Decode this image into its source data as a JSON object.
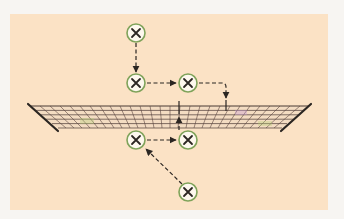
{
  "diagram": {
    "colors": {
      "background": "#f7f5f2",
      "court": "#fbe2c5",
      "marker_fill": "#fdf8ee",
      "marker_ring": "#7fa35a",
      "marker_x": "#2b2622",
      "arrow": "#2b2622",
      "net_line": "#3a2e2a",
      "net_pole": "#2b2622"
    },
    "players": [
      {
        "id": "p1",
        "label": "X",
        "x": 136,
        "y": 33,
        "side": "far"
      },
      {
        "id": "p2",
        "label": "X",
        "x": 136,
        "y": 83,
        "side": "far"
      },
      {
        "id": "p3",
        "label": "X",
        "x": 188,
        "y": 83,
        "side": "far"
      },
      {
        "id": "p4",
        "label": "X",
        "x": 136,
        "y": 140,
        "side": "near"
      },
      {
        "id": "p5",
        "label": "X",
        "x": 188,
        "y": 140,
        "side": "near"
      },
      {
        "id": "p6",
        "label": "X",
        "x": 188,
        "y": 192,
        "side": "near"
      }
    ],
    "arrows": [
      {
        "from": "p1",
        "to": "p2",
        "style": "dashed"
      },
      {
        "from": "p2",
        "to": "p3",
        "style": "dashed"
      },
      {
        "from": "p3",
        "to": "net",
        "style": "dashed",
        "path": "right-then-down"
      },
      {
        "from": "p4",
        "to": "p5",
        "style": "dashed"
      },
      {
        "from": "p5",
        "to": "net",
        "style": "dashed",
        "path": "up"
      },
      {
        "from": "p6",
        "to": "p4",
        "style": "dashed",
        "path": "diagonal"
      }
    ],
    "net": {
      "top_left": [
        28,
        105
      ],
      "top_right": [
        311,
        105
      ],
      "bottom_left": [
        58,
        130
      ],
      "bottom_right": [
        282,
        130
      ]
    }
  }
}
